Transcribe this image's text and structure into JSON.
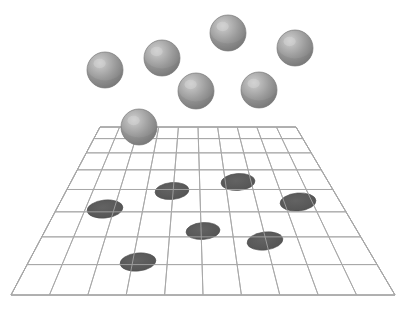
{
  "figure": {
    "kind": "3d-scene-illustration",
    "canvas": {
      "width": 407,
      "height": 310
    },
    "background_color": "#ffffff"
  },
  "palette": {
    "background": "#ffffff",
    "grid_line": "#a8a8a8",
    "grid_line_border": "#9a9a9a",
    "sphere_base": "#8c8c8c",
    "sphere_highlight": "#c8c8c8",
    "sphere_mid": "#9e9e9e",
    "sphere_shadow": "#6e6e6e",
    "sphere_outline": "#7a7a7a",
    "ellipse_fill": "#595959",
    "ellipse_outline": "#4f4f4f"
  },
  "grid": {
    "name": "perspective-ground-plane",
    "corners": {
      "top_left": {
        "x": 100,
        "y": 127
      },
      "top_right": {
        "x": 296,
        "y": 127
      },
      "bottom_right": {
        "x": 395,
        "y": 295
      },
      "bottom_left": {
        "x": 11,
        "y": 295
      }
    },
    "columns": 10,
    "rows": 8,
    "line_color": "#a8a8a8",
    "line_width": 1,
    "show_border": true
  },
  "spheres": [
    {
      "id": "sphere-1",
      "cx": 105,
      "cy": 70,
      "r": 18
    },
    {
      "id": "sphere-2",
      "cx": 162,
      "cy": 58,
      "r": 18
    },
    {
      "id": "sphere-3",
      "cx": 228,
      "cy": 33,
      "r": 18
    },
    {
      "id": "sphere-4",
      "cx": 295,
      "cy": 48,
      "r": 18
    },
    {
      "id": "sphere-5",
      "cx": 196,
      "cy": 91,
      "r": 18
    },
    {
      "id": "sphere-6",
      "cx": 259,
      "cy": 90,
      "r": 18
    },
    {
      "id": "sphere-7",
      "cx": 139,
      "cy": 127,
      "r": 18
    }
  ],
  "shadow_ellipses": [
    {
      "id": "ellipse-1",
      "cx": 105,
      "cy": 209,
      "rx": 18,
      "ry": 9,
      "rotate": -6
    },
    {
      "id": "ellipse-2",
      "cx": 172,
      "cy": 191,
      "rx": 17,
      "ry": 8.5,
      "rotate": -5
    },
    {
      "id": "ellipse-3",
      "cx": 238,
      "cy": 182,
      "rx": 17,
      "ry": 8.5,
      "rotate": -4
    },
    {
      "id": "ellipse-4",
      "cx": 298,
      "cy": 202,
      "rx": 18,
      "ry": 9,
      "rotate": -5
    },
    {
      "id": "ellipse-5",
      "cx": 203,
      "cy": 231,
      "rx": 17,
      "ry": 8.5,
      "rotate": -4
    },
    {
      "id": "ellipse-6",
      "cx": 265,
      "cy": 241,
      "rx": 18,
      "ry": 9,
      "rotate": -7
    },
    {
      "id": "ellipse-7",
      "cx": 138,
      "cy": 262,
      "rx": 18,
      "ry": 9,
      "rotate": -6
    }
  ],
  "counts": {
    "sphere_count": 7,
    "ellipse_count": 7
  },
  "labels": {
    "caption": "",
    "title": ""
  }
}
